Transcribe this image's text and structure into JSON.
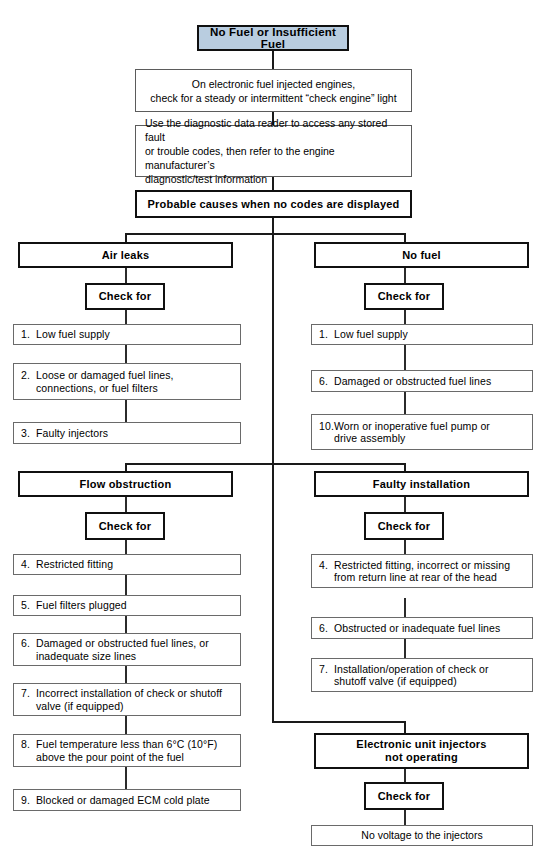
{
  "diagram": {
    "title": "No Fuel or Insufficient Fuel",
    "title_fill": "#b9cde0",
    "step1": "On electronic fuel injected engines,\ncheck for a steady or intermittent “check engine” light",
    "step2": "Use the diagnostic data reader to access any stored fault\nor trouble codes, then refer to the engine manufacturer’s\ndiagnostic/test information",
    "step3": "Probable causes when no codes are displayed",
    "check_for": "Check for",
    "branches": {
      "air_leaks": {
        "heading": "Air leaks",
        "check_label": "Check for",
        "items": [
          {
            "num": "1.",
            "text": "Low fuel supply"
          },
          {
            "num": "2.",
            "text": "Loose or damaged fuel lines,\nconnections, or fuel filters"
          },
          {
            "num": "3.",
            "text": "Faulty injectors"
          }
        ]
      },
      "no_fuel": {
        "heading": "No fuel",
        "check_label": "Check for",
        "items": [
          {
            "num": "1.",
            "text": "Low fuel supply"
          },
          {
            "num": "6.",
            "text": "Damaged or obstructed fuel lines"
          },
          {
            "num": "10.",
            "text": "Worn or inoperative fuel pump or\ndrive assembly"
          }
        ]
      },
      "flow_obstruction": {
        "heading": "Flow obstruction",
        "check_label": "Check for",
        "items": [
          {
            "num": "4.",
            "text": "Restricted fitting"
          },
          {
            "num": "5.",
            "text": "Fuel filters plugged"
          },
          {
            "num": "6.",
            "text": "Damaged or obstructed fuel lines, or\ninadequate size lines"
          },
          {
            "num": "7.",
            "text": "Incorrect installation of check or shutoff\nvalve (if equipped)"
          },
          {
            "num": "8.",
            "text": "Fuel temperature less than 6°C (10°F)\nabove the pour point of the fuel"
          },
          {
            "num": "9.",
            "text": "Blocked or damaged ECM cold plate"
          }
        ]
      },
      "faulty_installation": {
        "heading": "Faulty installation",
        "check_label": "Check for",
        "items": [
          {
            "num": "4.",
            "text": "Restricted fitting, incorrect or missing\nfrom return line at rear of the head"
          },
          {
            "num": "6.",
            "text": "Obstructed or inadequate fuel lines"
          },
          {
            "num": "7.",
            "text": "Installation/operation of check or\nshutoff valve (if equipped)"
          }
        ]
      },
      "electronic_unit_injectors": {
        "heading": "Electronic unit injectors\nnot operating",
        "check_label": "Check for",
        "items": [
          {
            "num": "",
            "text": "No voltage to the injectors"
          }
        ]
      }
    }
  }
}
